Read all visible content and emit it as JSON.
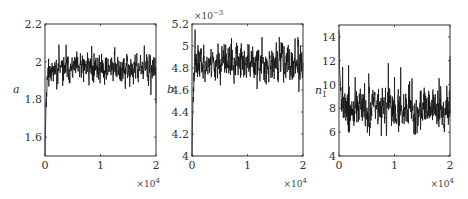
{
  "chart_data": [
    {
      "type": "line",
      "title": "",
      "ylabel": "a",
      "xlabel": "",
      "x_multiplier": "×10^4",
      "xlim": [
        0,
        2
      ],
      "ylim": [
        1.5,
        2.2
      ],
      "xticks": [
        0,
        1,
        2
      ],
      "yticks": [
        1.6,
        1.8,
        2,
        2.2
      ],
      "ytick_labels": [
        "1.6",
        "1.8",
        "2",
        "2.2"
      ],
      "y_multiplier": "",
      "grid": false,
      "description": "MCMC trace: burn-in rising from 1.5 to ~1.97, then fluctuating between ~1.8 and ~2.09",
      "burn_in": {
        "x_end": 0.05,
        "start": 1.5
      },
      "steady": {
        "mean": 1.965,
        "spread": 0.04,
        "min": 1.8,
        "max": 2.09
      },
      "seed": 11
    },
    {
      "type": "line",
      "title": "",
      "ylabel": "b",
      "xlabel": "",
      "x_multiplier": "×10^4",
      "xlim": [
        0,
        2
      ],
      "ylim": [
        4.0,
        5.2
      ],
      "xticks": [
        0,
        1,
        2
      ],
      "yticks": [
        4,
        4.2,
        4.4,
        4.6,
        4.8,
        5,
        5.2
      ],
      "ytick_labels": [
        "4",
        "4.2",
        "4.4",
        "4.6",
        "4.8",
        "5",
        "5.2"
      ],
      "y_multiplier": "×10^-3",
      "grid": false,
      "description": "MCMC trace: initial spike ~5.15 near start, then fluctuating ~4.52–5.08 around 4.85",
      "burn_in": {
        "x_end": 0.05,
        "start": 4.0
      },
      "steady": {
        "mean": 4.85,
        "spread": 0.09,
        "min": 4.52,
        "max": 5.08
      },
      "seed": 23
    },
    {
      "type": "line",
      "title": "",
      "ylabel": "n_1",
      "xlabel": "",
      "x_multiplier": "×10^4",
      "xlim": [
        0,
        2
      ],
      "ylim": [
        4,
        15
      ],
      "xticks": [
        0,
        1,
        2
      ],
      "yticks": [
        4,
        6,
        8,
        10,
        12,
        14
      ],
      "ytick_labels": [
        "4",
        "6",
        "8",
        "10",
        "12",
        "14"
      ],
      "y_multiplier": "",
      "grid": false,
      "description": "MCMC trace: starts near 15, drops to ~8, fluctuating ~5.8–12 around 8",
      "burn_in": {
        "x_end": 0.05,
        "start": 15
      },
      "steady": {
        "mean": 8.0,
        "spread": 0.9,
        "min": 5.7,
        "max": 12.4
      },
      "seed": 37
    }
  ],
  "panels": [
    {
      "ylabel": "a",
      "ylabel_sub": "",
      "x_mult_base": "×10",
      "x_mult_exp": "4",
      "y_mult_base": "",
      "y_mult_exp": ""
    },
    {
      "ylabel": "b",
      "ylabel_sub": "",
      "x_mult_base": "×10",
      "x_mult_exp": "4",
      "y_mult_base": "×10",
      "y_mult_exp": "−3"
    },
    {
      "ylabel": "n",
      "ylabel_sub": "1",
      "x_mult_base": "×10",
      "x_mult_exp": "4",
      "y_mult_base": "",
      "y_mult_exp": ""
    }
  ]
}
